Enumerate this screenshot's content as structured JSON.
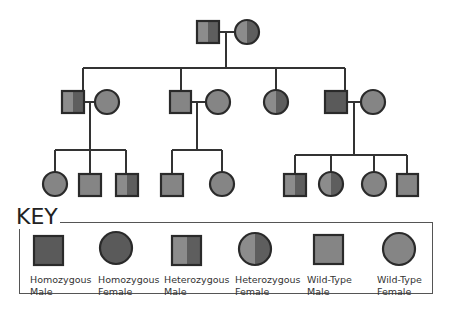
{
  "colors": {
    "homozygous": "#5a5a5a",
    "heterozygous_light": "#8a8a8a",
    "heterozygous_dark": "#5c5c5c",
    "wild_type": "#858585",
    "stroke": "#2a2a2a",
    "line": "#333333"
  },
  "pedigree": {
    "generation_1": [
      {
        "sex": "male",
        "genotype": "heterozygous"
      },
      {
        "sex": "female",
        "genotype": "heterozygous"
      }
    ],
    "generation_2": [
      {
        "sex": "male",
        "genotype": "heterozygous",
        "spouse": {
          "sex": "female",
          "genotype": "wild-type"
        }
      },
      {
        "sex": "male",
        "genotype": "wild-type",
        "spouse": {
          "sex": "female",
          "genotype": "wild-type"
        }
      },
      {
        "sex": "female",
        "genotype": "heterozygous"
      },
      {
        "sex": "male",
        "genotype": "homozygous",
        "spouse": {
          "sex": "female",
          "genotype": "wild-type"
        }
      }
    ],
    "generation_3": {
      "family_1": [
        {
          "sex": "female",
          "genotype": "wild-type"
        },
        {
          "sex": "male",
          "genotype": "wild-type"
        },
        {
          "sex": "male",
          "genotype": "heterozygous"
        }
      ],
      "family_2": [
        {
          "sex": "male",
          "genotype": "wild-type"
        },
        {
          "sex": "female",
          "genotype": "wild-type"
        }
      ],
      "family_3": [
        {
          "sex": "male",
          "genotype": "heterozygous"
        },
        {
          "sex": "female",
          "genotype": "heterozygous"
        },
        {
          "sex": "female",
          "genotype": "wild-type"
        },
        {
          "sex": "male",
          "genotype": "wild-type"
        }
      ]
    }
  },
  "key": {
    "title": "KEY",
    "items": [
      {
        "label": "Homozygous\nMale",
        "shape": "square",
        "genotype": "homozygous"
      },
      {
        "label": "Homozygous\nFemale",
        "shape": "circle",
        "genotype": "homozygous"
      },
      {
        "label": "Heterozygous\nMale",
        "shape": "square",
        "genotype": "heterozygous"
      },
      {
        "label": "Heterozygous\nFemale",
        "shape": "circle",
        "genotype": "heterozygous"
      },
      {
        "label": "Wild-Type\nMale",
        "shape": "square",
        "genotype": "wild-type"
      },
      {
        "label": "Wild-Type\nFemale",
        "shape": "circle",
        "genotype": "wild-type"
      }
    ]
  }
}
